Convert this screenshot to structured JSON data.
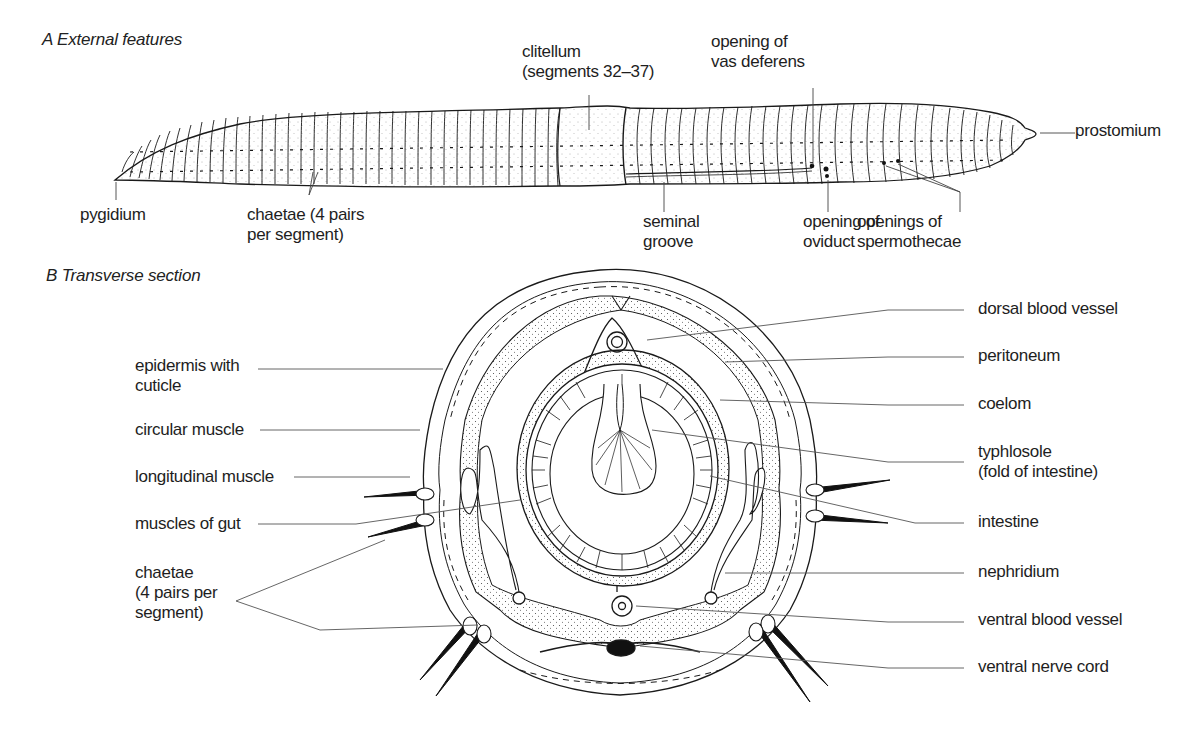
{
  "panel_a": {
    "title": "A  External features",
    "labels": {
      "clitellum": [
        "clitellum",
        "(segments 32–37)"
      ],
      "vas_deferens": [
        "opening of",
        "vas deferens"
      ],
      "prostomium": [
        "prostomium"
      ],
      "pygidium": [
        "pygidium"
      ],
      "chaetae": [
        "chaetae (4 pairs",
        "per segment)"
      ],
      "seminal_groove": [
        "seminal",
        "groove"
      ],
      "oviduct": [
        "opening of",
        "oviduct"
      ],
      "spermothecae": [
        "openings of",
        "spermothecae"
      ]
    }
  },
  "panel_b": {
    "title": "B  Transverse section",
    "left_labels": {
      "epidermis": [
        "epidermis with",
        "cuticle"
      ],
      "circular_muscle": [
        "circular muscle"
      ],
      "longitudinal_muscle": [
        "longitudinal muscle"
      ],
      "muscles_of_gut": [
        "muscles of gut"
      ],
      "chaetae": [
        "chaetae",
        "(4 pairs per",
        "segment)"
      ]
    },
    "right_labels": {
      "dorsal_blood_vessel": [
        "dorsal blood vessel"
      ],
      "peritoneum": [
        "peritoneum"
      ],
      "coelom": [
        "coelom"
      ],
      "typhlosole": [
        "typhlosole",
        "(fold of intestine)"
      ],
      "intestine": [
        "intestine"
      ],
      "nephridium": [
        "nephridium"
      ],
      "ventral_blood_vessel": [
        "ventral blood vessel"
      ],
      "ventral_nerve_cord": [
        "ventral nerve cord"
      ]
    }
  },
  "colors": {
    "ink": "#1a1a1a",
    "leader": "#555555",
    "background": "#ffffff"
  }
}
